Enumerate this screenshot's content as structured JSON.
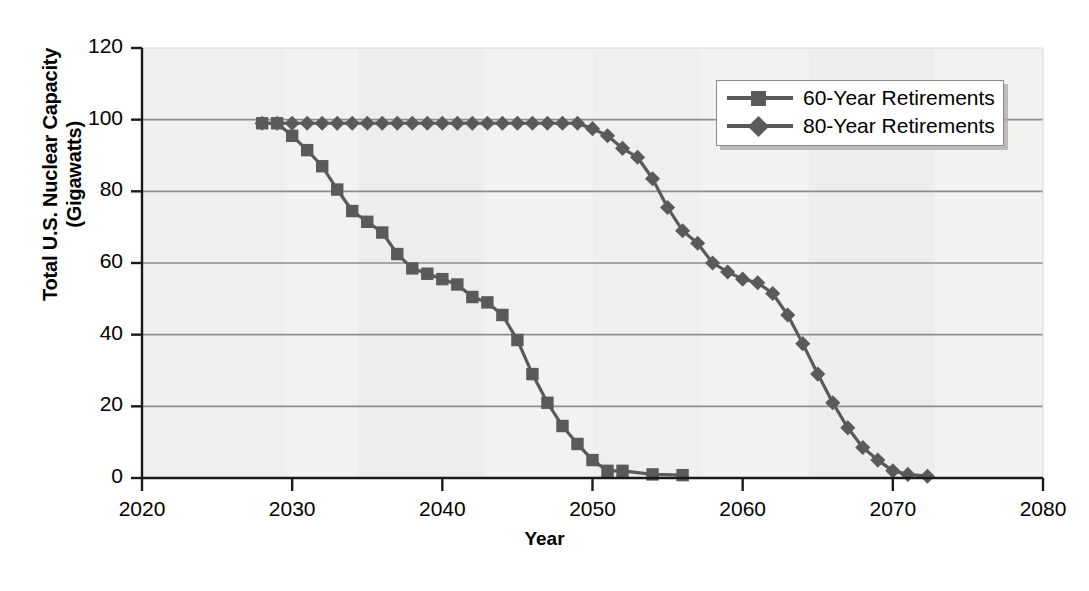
{
  "chart_data": {
    "type": "line",
    "title": "",
    "xlabel": "Year",
    "ylabel": "Total U.S. Nuclear Capacity (Gigawatts)",
    "ylabel_line1": "Total U.S. Nuclear Capacity",
    "ylabel_line2": "(Gigawatts)",
    "xlim": [
      2020,
      2080
    ],
    "ylim": [
      0,
      120
    ],
    "xticks": [
      2020,
      2030,
      2040,
      2050,
      2060,
      2070,
      2080
    ],
    "yticks": [
      0,
      20,
      40,
      60,
      80,
      100,
      120
    ],
    "grid": "horizontal",
    "legend_position": "top-right",
    "series": [
      {
        "name": "60-Year Retirements",
        "marker": "square",
        "color": "#5a5a5a",
        "points": [
          [
            2028.0,
            99.0
          ],
          [
            2029.0,
            99.0
          ],
          [
            2030.0,
            95.5
          ],
          [
            2031.0,
            91.5
          ],
          [
            2032.0,
            87.0
          ],
          [
            2033.0,
            80.5
          ],
          [
            2034.0,
            74.5
          ],
          [
            2035.0,
            71.5
          ],
          [
            2036.0,
            68.5
          ],
          [
            2037.0,
            62.5
          ],
          [
            2038.0,
            58.5
          ],
          [
            2039.0,
            57.0
          ],
          [
            2040.0,
            55.5
          ],
          [
            2041.0,
            54.0
          ],
          [
            2042.0,
            50.5
          ],
          [
            2043.0,
            49.0
          ],
          [
            2044.0,
            45.5
          ],
          [
            2045.0,
            38.5
          ],
          [
            2046.0,
            29.0
          ],
          [
            2047.0,
            21.0
          ],
          [
            2048.0,
            14.5
          ],
          [
            2049.0,
            9.5
          ],
          [
            2050.0,
            5.0
          ],
          [
            2051.0,
            2.0
          ],
          [
            2052.0,
            2.0
          ],
          [
            2054.0,
            1.0
          ],
          [
            2056.0,
            0.8
          ]
        ]
      },
      {
        "name": "80-Year Retirements",
        "marker": "diamond",
        "color": "#5a5a5a",
        "points": [
          [
            2028.0,
            99.0
          ],
          [
            2029.0,
            99.0
          ],
          [
            2030.0,
            99.0
          ],
          [
            2031.0,
            99.0
          ],
          [
            2032.0,
            99.0
          ],
          [
            2033.0,
            99.0
          ],
          [
            2034.0,
            99.0
          ],
          [
            2035.0,
            99.0
          ],
          [
            2036.0,
            99.0
          ],
          [
            2037.0,
            99.0
          ],
          [
            2038.0,
            99.0
          ],
          [
            2039.0,
            99.0
          ],
          [
            2040.0,
            99.0
          ],
          [
            2041.0,
            99.0
          ],
          [
            2042.0,
            99.0
          ],
          [
            2043.0,
            99.0
          ],
          [
            2044.0,
            99.0
          ],
          [
            2045.0,
            99.0
          ],
          [
            2046.0,
            99.0
          ],
          [
            2047.0,
            99.0
          ],
          [
            2048.0,
            99.0
          ],
          [
            2049.0,
            99.0
          ],
          [
            2050.0,
            97.5
          ],
          [
            2051.0,
            95.5
          ],
          [
            2052.0,
            92.0
          ],
          [
            2053.0,
            89.5
          ],
          [
            2054.0,
            83.5
          ],
          [
            2055.0,
            75.5
          ],
          [
            2056.0,
            69.0
          ],
          [
            2057.0,
            65.5
          ],
          [
            2058.0,
            60.0
          ],
          [
            2059.0,
            57.5
          ],
          [
            2060.0,
            55.5
          ],
          [
            2061.0,
            54.5
          ],
          [
            2062.0,
            51.5
          ],
          [
            2063.0,
            45.5
          ],
          [
            2064.0,
            37.5
          ],
          [
            2065.0,
            29.0
          ],
          [
            2066.0,
            21.0
          ],
          [
            2067.0,
            14.0
          ],
          [
            2068.0,
            8.5
          ],
          [
            2069.0,
            5.0
          ],
          [
            2070.0,
            2.0
          ],
          [
            2071.0,
            1.0
          ],
          [
            2072.3,
            0.5
          ]
        ]
      }
    ]
  },
  "legend": {
    "items": [
      {
        "label": "60-Year Retirements"
      },
      {
        "label": "80-Year Retirements"
      }
    ]
  },
  "axes": {
    "x_title": "Year",
    "y_title_line1": "Total U.S. Nuclear Capacity",
    "y_title_line2": "(Gigawatts)",
    "x_tick_labels": [
      "2020",
      "2030",
      "2040",
      "2050",
      "2060",
      "2070",
      "2080"
    ],
    "y_tick_labels": [
      "0",
      "20",
      "40",
      "60",
      "80",
      "100",
      "120"
    ]
  },
  "colors": {
    "series": "#5a5a5a",
    "plot_background": "#f2f2f0",
    "grid": "#8d8d8d",
    "axis": "#1a1a1a"
  }
}
